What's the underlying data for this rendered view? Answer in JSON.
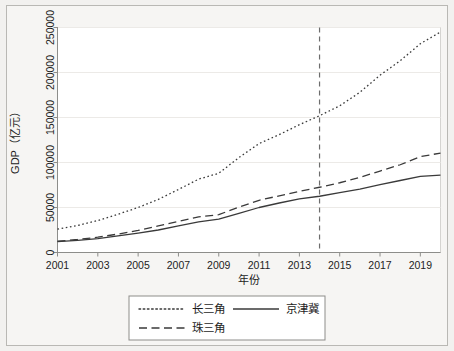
{
  "chart_data": {
    "type": "line",
    "title": "",
    "xlabel": "年份",
    "ylabel": "GDP（亿元）",
    "xlim": [
      2001,
      2020
    ],
    "ylim": [
      0,
      250000
    ],
    "grid": false,
    "legend_position": "bottom",
    "x": [
      2001,
      2002,
      2003,
      2004,
      2005,
      2006,
      2007,
      2008,
      2009,
      2010,
      2011,
      2012,
      2013,
      2014,
      2015,
      2016,
      2017,
      2018,
      2019,
      2020
    ],
    "xticks": [
      2001,
      2003,
      2005,
      2007,
      2009,
      2011,
      2013,
      2015,
      2017,
      2019
    ],
    "yticks": [
      0,
      50000,
      100000,
      150000,
      200000,
      250000
    ],
    "ytick_labels": [
      "0",
      "50000",
      "100000",
      "150000",
      "200000",
      "250000"
    ],
    "annotations": [
      {
        "type": "vline",
        "x": 2014,
        "style": "dashed",
        "label": ""
      }
    ],
    "series": [
      {
        "name": "长三角",
        "style": "dotted",
        "values": [
          26000,
          30000,
          35500,
          42500,
          50000,
          59000,
          70000,
          81500,
          88000,
          105500,
          121000,
          131000,
          142000,
          152000,
          163000,
          178000,
          197000,
          213000,
          232000,
          245000
        ]
      },
      {
        "name": "京津冀",
        "style": "solid",
        "values": [
          12000,
          13500,
          15500,
          18500,
          21500,
          25000,
          29500,
          34000,
          37000,
          43500,
          50000,
          55000,
          59500,
          62500,
          66500,
          70500,
          75500,
          80000,
          84500,
          86000
        ]
      },
      {
        "name": "珠三角",
        "style": "dashed",
        "values": [
          12500,
          14500,
          17000,
          20500,
          24500,
          29500,
          34500,
          39500,
          42000,
          50500,
          58000,
          63000,
          68000,
          72500,
          77500,
          83500,
          90500,
          97500,
          106500,
          110500
        ]
      }
    ]
  },
  "axes": {
    "y_title": "GDP（亿元）",
    "x_title": "年份"
  },
  "legend": {
    "entries": [
      {
        "label": "长三角",
        "style": "dotted"
      },
      {
        "label": "京津冀",
        "style": "solid"
      },
      {
        "label": "珠三角",
        "style": "dashed"
      }
    ]
  }
}
